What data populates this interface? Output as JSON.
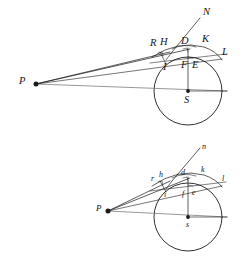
{
  "document": {
    "title": "Geometric optics figure: refraction of rays from point P at a spherical surface",
    "background_color": "#ffffff",
    "ink_color": "#1a1a1a",
    "width": 246,
    "height": 261
  },
  "figures": [
    {
      "id": "upper-figure",
      "name": "upper-diagram",
      "label_case": "uppercase",
      "circle": {
        "cx": 188,
        "cy": 91,
        "r": 34,
        "center_label": "S"
      },
      "source_point": {
        "label": "P",
        "x": 36,
        "y": 84
      },
      "labels": [
        {
          "id": "P",
          "text": "P",
          "x": 19,
          "y": 78,
          "point_x": 36,
          "point_y": 84
        },
        {
          "id": "N",
          "text": "N",
          "x": 202,
          "y": 9,
          "point_x": 198,
          "point_y": 20
        },
        {
          "id": "R",
          "text": "R",
          "x": 152,
          "y": 40,
          "point_x": 158,
          "point_y": 54
        },
        {
          "id": "H",
          "text": "H",
          "x": 161,
          "y": 39,
          "point_x": 167,
          "point_y": 50
        },
        {
          "id": "D",
          "text": "D",
          "x": 183,
          "y": 38,
          "point_x": 186,
          "point_y": 49
        },
        {
          "id": "K",
          "text": "K",
          "x": 203,
          "y": 36,
          "point_x": 203,
          "point_y": 48
        },
        {
          "id": "L",
          "text": "L",
          "x": 222,
          "y": 49,
          "point_x": 219,
          "point_y": 60
        },
        {
          "id": "I",
          "text": "I",
          "x": 162,
          "y": 64,
          "point_x": 165,
          "point_y": 62
        },
        {
          "id": "F",
          "text": "F",
          "x": 183,
          "y": 62,
          "point_x": 186,
          "point_y": 60
        },
        {
          "id": "E",
          "text": "E",
          "x": 194,
          "y": 62,
          "point_x": 192,
          "point_y": 60
        },
        {
          "id": "S",
          "text": "S",
          "x": 185,
          "y": 97,
          "point_x": 188,
          "point_y": 91
        }
      ]
    },
    {
      "id": "lower-figure",
      "name": "lower-diagram",
      "label_case": "lowercase",
      "circle": {
        "cx": 188,
        "cy": 217,
        "r": 34,
        "center_label": "s"
      },
      "source_point": {
        "label": "P",
        "x": 108,
        "y": 211
      },
      "labels": [
        {
          "id": "p",
          "text": "P",
          "x": 96,
          "y": 206,
          "point_x": 108,
          "point_y": 211
        },
        {
          "id": "n",
          "text": "n",
          "x": 201,
          "y": 145,
          "point_x": 198,
          "point_y": 152
        },
        {
          "id": "r",
          "text": "r",
          "x": 152,
          "y": 176,
          "point_x": 158,
          "point_y": 183
        },
        {
          "id": "h",
          "text": "h",
          "x": 160,
          "y": 173,
          "point_x": 167,
          "point_y": 180
        },
        {
          "id": "d",
          "text": "d",
          "x": 182,
          "y": 171,
          "point_x": 186,
          "point_y": 178
        },
        {
          "id": "k",
          "text": "k",
          "x": 201,
          "y": 168,
          "point_x": 203,
          "point_y": 176
        },
        {
          "id": "l",
          "text": "l",
          "x": 222,
          "y": 177,
          "point_x": 219,
          "point_y": 186
        },
        {
          "id": "i",
          "text": "i",
          "x": 163,
          "y": 193,
          "point_x": 165,
          "point_y": 190
        },
        {
          "id": "f",
          "text": "f",
          "x": 182,
          "y": 192,
          "point_x": 186,
          "point_y": 189
        },
        {
          "id": "e",
          "text": "e",
          "x": 193,
          "y": 190,
          "point_x": 192,
          "point_y": 188
        },
        {
          "id": "s",
          "text": "s",
          "x": 186,
          "y": 223,
          "point_x": 188,
          "point_y": 217
        }
      ]
    }
  ],
  "strokes": {
    "thin": 0.6,
    "medium": 0.8,
    "circle": 0.9,
    "dot_radius": 2.4
  }
}
